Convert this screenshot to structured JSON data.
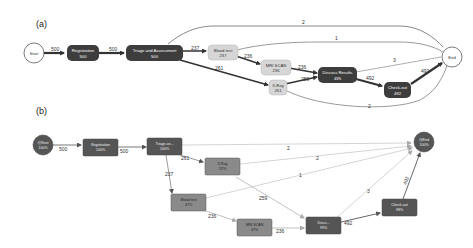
{
  "panels": {
    "a": {
      "label": "(a)",
      "nodes": {
        "start": {
          "name": "Start"
        },
        "registration": {
          "name": "Registration",
          "count": "500"
        },
        "triage": {
          "name": "Triage and Assessment",
          "count": "500"
        },
        "blood_test": {
          "name": "Blood test",
          "count": "237"
        },
        "mri_scan": {
          "name": "MRI SCAN",
          "count": "236"
        },
        "xray": {
          "name": "X-Ray",
          "count": "261"
        },
        "discuss_results": {
          "name": "Discuss Results",
          "count": "495"
        },
        "check_out": {
          "name": "Check-out",
          "count": "492"
        },
        "end": {
          "name": "End"
        }
      },
      "edges": {
        "start_registration": "500",
        "registration_triage": "500",
        "triage_blood": "237",
        "triage_xray": "261",
        "triage_end": "2",
        "blood_mri": "236",
        "blood_end": "1",
        "mri_discuss": "236",
        "xray_discuss": "259",
        "xray_end": "2",
        "discuss_checkout": "492",
        "discuss_end": "3",
        "checkout_end": "492"
      }
    },
    "b": {
      "label": "(b)",
      "nodes": {
        "start": {
          "name": "@Start",
          "pct": "100%"
        },
        "registration": {
          "name": "Registration",
          "pct": "100%"
        },
        "triage": {
          "name": "Triage an...",
          "pct": "100%"
        },
        "xray": {
          "name": "X-Ray",
          "pct": "52%"
        },
        "blood_test": {
          "name": "Blood test",
          "pct": "47%"
        },
        "mri_scan": {
          "name": "MRI SCAN",
          "pct": "47%"
        },
        "discuss_results": {
          "name": "Discu...",
          "pct": "99%"
        },
        "check_out": {
          "name": "Check-out",
          "pct": "98%"
        },
        "end": {
          "name": "@End",
          "pct": "100%"
        }
      },
      "edges": {
        "start_registration": "500",
        "registration_triage": "500",
        "triage_xray": "261",
        "triage_blood": "237",
        "triage_end": "2",
        "xray_end": "2",
        "blood_end": "1",
        "xray_discuss": "259",
        "blood_mri": "236",
        "mri_discuss": "236",
        "discuss_checkout": "492",
        "discuss_end": "3",
        "checkout_end": "492"
      }
    }
  },
  "colors": {
    "dark_node": "#3d3d3d",
    "light_node": "#d6d6d6",
    "b_dark_node": "#555555",
    "b_mid_node": "#8a8a8a",
    "edge_dark": "#333333",
    "edge_light": "#9a9a9a"
  }
}
